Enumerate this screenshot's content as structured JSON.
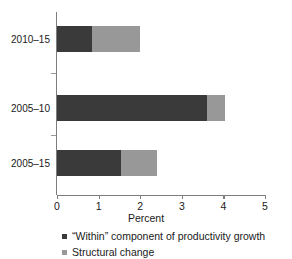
{
  "chart_data": {
    "type": "bar",
    "orientation": "horizontal",
    "stacked": true,
    "title": "",
    "xlabel": "Percent",
    "ylabel": "",
    "xlim": [
      0,
      5
    ],
    "xticks": [
      0,
      1,
      2,
      3,
      4,
      5
    ],
    "xtick_labels": [
      "0",
      "1",
      "2",
      "3",
      "4",
      "5"
    ],
    "grid": false,
    "legend_position": "below-left",
    "categories": [
      "2010–15",
      "2005–10",
      "2005–15"
    ],
    "series": [
      {
        "name": "“Within” component of productivity growth",
        "color": "#3a3a3a",
        "values": [
          0.85,
          3.6,
          1.55
        ]
      },
      {
        "name": "Structural change",
        "color": "#989898",
        "values": [
          1.15,
          0.45,
          0.85
        ]
      }
    ],
    "totals": [
      2.0,
      4.05,
      2.4
    ],
    "legend": [
      {
        "label": "“Within” component of productivity growth",
        "swatch": "#3a3a3a",
        "marker": "square-marker"
      },
      {
        "label": "Structural change",
        "swatch": "#989898",
        "marker": "square-marker"
      }
    ]
  },
  "axis": {
    "x_title": "Percent"
  },
  "colors": {
    "within": "#3a3a3a",
    "structural": "#989898",
    "axis": "#7d7d7d",
    "background": "#ffffff"
  }
}
